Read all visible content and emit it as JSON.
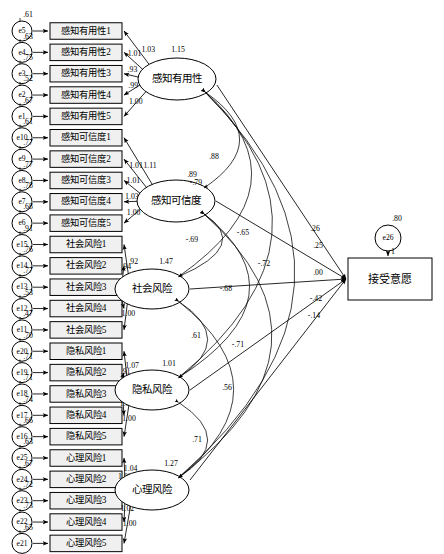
{
  "diagram": {
    "type": "sem-path-diagram",
    "outcome": {
      "label": "接受意愿",
      "error": {
        "name": "e26",
        "value": ".80"
      },
      "error_path_label": "1"
    },
    "latents": [
      {
        "id": "pu",
        "label": "感知有用性",
        "variance": "1.15",
        "indicators": [
          {
            "label": "感知有用性1",
            "error": "e5",
            "error_value": ".61",
            "loading": "1.03"
          },
          {
            "label": "感知有用性2",
            "error": "e4",
            "error_value": ".63",
            "loading": "1.01"
          },
          {
            "label": "感知有用性3",
            "error": "e3",
            "error_value": ".75",
            "loading": ".93"
          },
          {
            "label": "感知有用性4",
            "error": "e2",
            "error_value": ".52",
            "loading": ".99"
          },
          {
            "label": "感知有用性5",
            "error": "e1",
            "error_value": ".67",
            "loading": "1.00"
          }
        ]
      },
      {
        "id": "pc",
        "label": "感知可信度",
        "variance": ".89",
        "indicators": [
          {
            "label": "感知可信度1",
            "error": "e10",
            "error_value": ".61",
            "loading": "1.11"
          },
          {
            "label": "感知可信度2",
            "error": "e9",
            "error_value": ".77",
            "loading": "1.01"
          },
          {
            "label": "感知可信度3",
            "error": "e8",
            "error_value": ".77",
            "loading": "1.01"
          },
          {
            "label": "感知可信度4",
            "error": "e7",
            "error_value": ".78",
            "loading": "1.03"
          },
          {
            "label": "感知可信度5",
            "error": "e6",
            "error_value": ".68",
            "loading": "1.00"
          }
        ]
      },
      {
        "id": "sr",
        "label": "社会风险",
        "variance": "1.47",
        "indicators": [
          {
            "label": "社会风险1",
            "error": "e15",
            "error_value": ".91",
            "loading": ".92"
          },
          {
            "label": "社会风险2",
            "error": "e14",
            "error_value": ".76",
            "loading": ".94"
          },
          {
            "label": "社会风险3",
            "error": "e13",
            "error_value": ".77",
            "loading": ".80"
          },
          {
            "label": "社会风险4",
            "error": "e12",
            "error_value": ".53",
            "loading": ".99"
          },
          {
            "label": "社会风险5",
            "error": "e11",
            "error_value": ".47",
            "loading": "1.00"
          }
        ]
      },
      {
        "id": "pr",
        "label": "隐私风险",
        "variance": "1.01",
        "indicators": [
          {
            "label": "隐私风险1",
            "error": "e20",
            "error_value": ".70",
            "loading": "1.07"
          },
          {
            "label": "隐私风险2",
            "error": "e19",
            "error_value": ".71",
            "loading": ".91"
          },
          {
            "label": "隐私风险3",
            "error": "e18",
            "error_value": ".71",
            "loading": ".96"
          },
          {
            "label": "隐私风险4",
            "error": "e17",
            "error_value": ".74",
            "loading": "1.01"
          },
          {
            "label": "隐私风险5",
            "error": "e16",
            "error_value": ".66",
            "loading": "1.00"
          }
        ]
      },
      {
        "id": "mr",
        "label": "心理风险",
        "variance": "1.27",
        "indicators": [
          {
            "label": "心理风险1",
            "error": "e25",
            "error_value": ".63",
            "loading": "1.04"
          },
          {
            "label": "心理风险2",
            "error": "e24",
            "error_value": ".67",
            "loading": "1.00"
          },
          {
            "label": "心理风险3",
            "error": "e23",
            "error_value": ".72",
            "loading": ".93"
          },
          {
            "label": "心理风险4",
            "error": "e22",
            "error_value": ".73",
            "loading": "1.02"
          },
          {
            "label": "心理风险5",
            "error": "e21",
            "error_value": ".65",
            "loading": "1.00"
          }
        ]
      }
    ],
    "structural_paths": [
      {
        "from": "pu",
        "to": "outcome",
        "value": ".26"
      },
      {
        "from": "pc",
        "to": "outcome",
        "value": ".25"
      },
      {
        "from": "sr",
        "to": "outcome",
        "value": ".00"
      },
      {
        "from": "pr",
        "to": "outcome",
        "value": "-.42"
      },
      {
        "from": "mr",
        "to": "outcome",
        "value": "-.14"
      }
    ],
    "covariances": [
      {
        "from": "pu",
        "to": "pc",
        "value": ".88"
      },
      {
        "from": "pu",
        "to": "sr",
        "value": "-.79"
      },
      {
        "from": "pu",
        "to": "pr",
        "value": "-.65"
      },
      {
        "from": "pu",
        "to": "mr",
        "value": "-.72"
      },
      {
        "from": "pc",
        "to": "sr",
        "value": "-.69"
      },
      {
        "from": "pc",
        "to": "pr",
        "value": "-.68"
      },
      {
        "from": "pc",
        "to": "mr",
        "value": "-.71"
      },
      {
        "from": "sr",
        "to": "pr",
        "value": ".61"
      },
      {
        "from": "sr",
        "to": "mr",
        "value": ".56"
      },
      {
        "from": "pr",
        "to": "mr",
        "value": ".71"
      }
    ]
  }
}
